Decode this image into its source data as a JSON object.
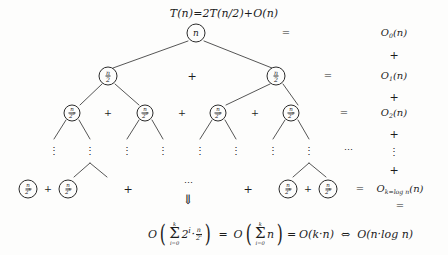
{
  "diagram": {
    "title": "T(n)=2T(n/2)+O(n)",
    "type": "recursion-tree",
    "background_color": "#fdfdfc",
    "ink_color": "#1c1c1c"
  },
  "levels": [
    {
      "index": 0,
      "node_label": "n",
      "node_count": 1,
      "equals": "=",
      "cost_term": "O",
      "cost_subscript": "0",
      "cost_arg": "(n)"
    },
    {
      "index": 1,
      "node_numerator": "n",
      "node_denominator": "2",
      "node_count": 2,
      "separator": "+",
      "equals": "=",
      "cost_term": "O",
      "cost_subscript": "1",
      "cost_arg": "(n)"
    },
    {
      "index": 2,
      "node_numerator": "n",
      "node_denominator": "2",
      "node_denominator_exponent": "2",
      "node_count": 4,
      "separator": "+",
      "equals": "=",
      "cost_term": "O",
      "cost_subscript": "2",
      "cost_arg": "(n)"
    },
    {
      "index": "k",
      "node_numerator": "n",
      "node_denominator": "2",
      "node_denominator_exponent": "k",
      "node_count": 4,
      "separator": "+",
      "equals": "=",
      "cost_term": "O",
      "cost_subscript": "k=log n",
      "cost_arg": "(n)"
    }
  ],
  "connectors": {
    "plus": "+",
    "equals": "=",
    "vertical_dots": "⋮",
    "horizontal_dots": "⋯",
    "double_down_arrow": "⇓",
    "iff": "⇔"
  },
  "right_column": {
    "sequence": [
      "O0(n)",
      "+",
      "O1(n)",
      "+",
      "O2(n)",
      "+",
      "⋮",
      "+",
      "Ok=log n(n)",
      "="
    ]
  },
  "bottom_formula": {
    "big_o": "O",
    "sigma": "Σ",
    "sum_lower": "i=0",
    "sum_upper": "k",
    "term1_base": "2",
    "term1_exponent": "i",
    "term1_dot": "·",
    "term1_numerator": "n",
    "term1_denominator": "2",
    "term1_denominator_exponent": "i",
    "equals_1": "=",
    "term2": "n",
    "equals_2": "=",
    "result1": "O(k·n)",
    "iff": "⇔",
    "result2": "O(n·log n)"
  }
}
